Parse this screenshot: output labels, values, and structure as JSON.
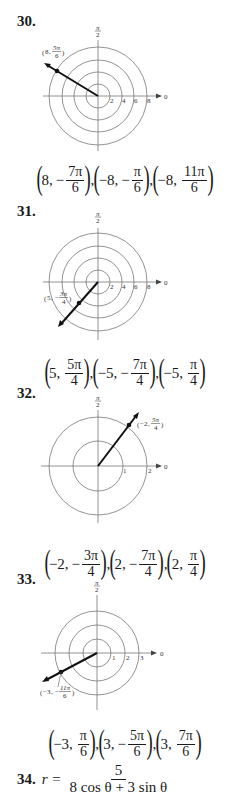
{
  "problems": [
    {
      "number": "30.",
      "plot": {
        "top_label_num": "π",
        "top_label_den": "2",
        "axis_label": "0",
        "ring_labels": [
          "2",
          "4",
          "6",
          "8"
        ],
        "point_label_r": "8",
        "point_label_num": "5π",
        "point_label_den": "6"
      },
      "answers": [
        {
          "r": "8",
          "sign": "−",
          "num": "7π",
          "den": "6"
        },
        {
          "r": "−8",
          "sign": "−",
          "num": "π",
          "den": "6"
        },
        {
          "r": "−8",
          "sign": "",
          "num": "11π",
          "den": "6"
        }
      ]
    },
    {
      "number": "31.",
      "plot": {
        "top_label_num": "π",
        "top_label_den": "2",
        "axis_label": "0",
        "ring_labels": [
          "2",
          "4",
          "6",
          "8"
        ],
        "point_label_r": "5",
        "point_label_num": "3π",
        "point_label_den": "4",
        "point_label_sign": "−"
      },
      "answers": [
        {
          "r": "5",
          "sign": "",
          "num": "5π",
          "den": "4"
        },
        {
          "r": "−5",
          "sign": "−",
          "num": "7π",
          "den": "4"
        },
        {
          "r": "−5",
          "sign": "",
          "num": "π",
          "den": "4"
        }
      ]
    },
    {
      "number": "32.",
      "plot": {
        "top_label_num": "π",
        "top_label_den": "2",
        "axis_label": "0",
        "ring_labels": [
          "1",
          "2"
        ],
        "point_label_r": "−2",
        "point_label_num": "5π",
        "point_label_den": "4"
      },
      "answers": [
        {
          "r": "−2",
          "sign": "−",
          "num": "3π",
          "den": "4"
        },
        {
          "r": "2",
          "sign": "−",
          "num": "7π",
          "den": "4"
        },
        {
          "r": "2",
          "sign": "",
          "num": "π",
          "den": "4"
        }
      ]
    },
    {
      "number": "33.",
      "plot": {
        "top_label_num": "π",
        "top_label_den": "2",
        "axis_label": "0",
        "ring_labels": [
          "1",
          "2",
          "3"
        ],
        "point_label_r": "−3",
        "point_label_num": "11π",
        "point_label_den": "6",
        "point_label_sign": "−"
      },
      "answers": [
        {
          "r": "−3",
          "sign": "",
          "num": "π",
          "den": "6"
        },
        {
          "r": "3",
          "sign": "−",
          "num": "5π",
          "den": "6"
        },
        {
          "r": "3",
          "sign": "",
          "num": "7π",
          "den": "6"
        }
      ]
    },
    {
      "number": "34.",
      "equation": {
        "lhs": "r =",
        "numerator": "5",
        "denominator": "8 cos θ + 3 sin θ"
      }
    }
  ]
}
